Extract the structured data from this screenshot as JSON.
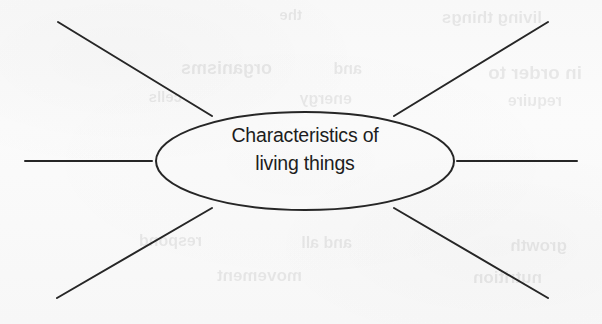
{
  "diagram": {
    "type": "spider-diagram",
    "title": "Characteristics of living things",
    "centre": {
      "shape": "ellipse",
      "label_line_1": "Characteristics of",
      "label_line_2": "living things",
      "cx": 305,
      "cy": 161,
      "rx": 149,
      "ry": 49
    },
    "branch_count": 6,
    "branches": [
      {
        "name": "branch-top-left",
        "label": "",
        "direction": "up-left",
        "x1": 58,
        "y1": 22,
        "x2": 212,
        "y2": 116
      },
      {
        "name": "branch-top-right",
        "label": "",
        "direction": "up-right",
        "x1": 548,
        "y1": 22,
        "x2": 394,
        "y2": 116
      },
      {
        "name": "branch-left",
        "label": "",
        "direction": "left",
        "x1": 25,
        "y1": 161,
        "x2": 152,
        "y2": 161
      },
      {
        "name": "branch-right",
        "label": "",
        "direction": "right",
        "x1": 577,
        "y1": 161,
        "x2": 457,
        "y2": 161
      },
      {
        "name": "branch-bottom-left",
        "label": "",
        "direction": "down-left",
        "x1": 57,
        "y1": 298,
        "x2": 212,
        "y2": 208
      },
      {
        "name": "branch-bottom-right",
        "label": "",
        "direction": "down-right",
        "x1": 548,
        "y1": 298,
        "x2": 394,
        "y2": 208
      }
    ],
    "colors": {
      "ink": "#262626",
      "paper": "#fafafa",
      "text": "#1d1d1d"
    },
    "stroke_width": 2
  },
  "background_bleed": {
    "note": "faint mirrored show-through text from the reverse of the scanned page",
    "fragments": [
      {
        "text": "living things",
        "x": 60,
        "y": 8,
        "size": 17
      },
      {
        "text": "the",
        "x": 300,
        "y": 6,
        "size": 15
      },
      {
        "text": "in order to",
        "x": 20,
        "y": 62,
        "size": 19
      },
      {
        "text": "and",
        "x": 240,
        "y": 60,
        "size": 16
      },
      {
        "text": "organisms",
        "x": 330,
        "y": 58,
        "size": 18
      },
      {
        "text": "require",
        "x": 40,
        "y": 92,
        "size": 16
      },
      {
        "text": "energy",
        "x": 250,
        "y": 90,
        "size": 16
      },
      {
        "text": "cells",
        "x": 420,
        "y": 88,
        "size": 15
      },
      {
        "text": "growth",
        "x": 35,
        "y": 236,
        "size": 17
      },
      {
        "text": "and all",
        "x": 250,
        "y": 234,
        "size": 16
      },
      {
        "text": "respond",
        "x": 400,
        "y": 232,
        "size": 16
      },
      {
        "text": "nutrition",
        "x": 60,
        "y": 268,
        "size": 17
      },
      {
        "text": "movement",
        "x": 300,
        "y": 266,
        "size": 17
      }
    ]
  }
}
